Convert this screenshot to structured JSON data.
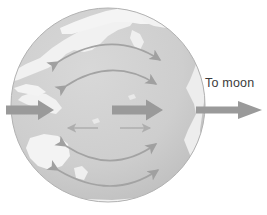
{
  "figure": {
    "title_text": "",
    "label_to_moon": "To moon",
    "background_color": "#ffffff",
    "globe": {
      "center_x": 108,
      "center_y": 105,
      "radius": 97,
      "ocean_color": "#cdcdcd",
      "land_color": "#f2f2f2",
      "outline_color": "#b4b4b4",
      "outline_width": 1
    },
    "arrows": {
      "color_major": "#9a9a9a",
      "color_arc": "#a6a6a6",
      "color_minor": "#b0b0b0",
      "major": [
        {
          "name": "left-inward-arrow",
          "x1": 6,
          "y1": 110,
          "x2": 52,
          "y2": 110,
          "direction": "right",
          "thickness": 9
        },
        {
          "name": "center-arrow",
          "x1": 112,
          "y1": 110,
          "x2": 158,
          "y2": 110,
          "direction": "right",
          "thickness": 9
        },
        {
          "name": "to-moon-arrow",
          "x1": 196,
          "y1": 110,
          "x2": 262,
          "y2": 110,
          "direction": "right",
          "thickness": 7
        }
      ],
      "minor_horizontal": [
        {
          "name": "small-left-arrow",
          "x1": 98,
          "y1": 128,
          "x2": 66,
          "y2": 128,
          "direction": "left"
        },
        {
          "name": "small-right-arrow",
          "x1": 120,
          "y1": 128,
          "x2": 152,
          "y2": 128,
          "direction": "right"
        }
      ],
      "upper_arcs": [
        {
          "name": "upper-arc-outer",
          "start_x": 58,
          "start_y": 62,
          "ctrl_x": 112,
          "ctrl_y": 28,
          "end_x": 160,
          "end_y": 60
        },
        {
          "name": "upper-arc-inner",
          "start_x": 66,
          "start_y": 86,
          "ctrl_x": 112,
          "ctrl_y": 56,
          "end_x": 156,
          "end_y": 84
        }
      ],
      "lower_arcs": [
        {
          "name": "lower-arc-inner",
          "start_x": 66,
          "start_y": 146,
          "ctrl_x": 112,
          "ctrl_y": 176,
          "end_x": 156,
          "end_y": 144
        },
        {
          "name": "lower-arc-outer",
          "start_x": 58,
          "start_y": 170,
          "ctrl_x": 112,
          "ctrl_y": 202,
          "end_x": 158,
          "end_y": 170
        }
      ]
    },
    "continents": {
      "description": "pacific-centred world map landmasses",
      "color": "#f2f2f2"
    }
  }
}
